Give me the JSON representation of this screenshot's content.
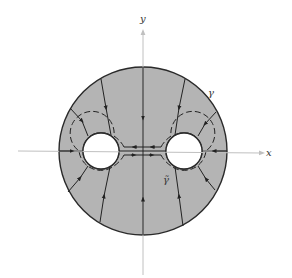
{
  "figure": {
    "axes": {
      "x_label": "x",
      "y_label": "y",
      "axis_color": "#b8b8b8"
    },
    "labels": {
      "outer_contour": "γ",
      "inner_contour": "γ̃"
    },
    "colors": {
      "region_fill": "#b4b4b4",
      "stroke": "#2a2a2a",
      "hole_fill": "#ffffff"
    },
    "geometry": {
      "outer_circle": {
        "cx": 143,
        "cy": 151,
        "r": 84
      },
      "holes": [
        {
          "cx": 101,
          "cy": 151,
          "r": 18
        },
        {
          "cx": 184,
          "cy": 151,
          "r": 18
        }
      ]
    }
  }
}
